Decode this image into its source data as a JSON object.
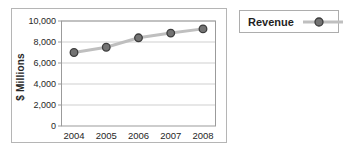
{
  "chart_data": {
    "type": "line",
    "categories": [
      "2004",
      "2005",
      "2006",
      "2007",
      "2008"
    ],
    "series": [
      {
        "name": "Revenue",
        "values": [
          7000,
          7500,
          8400,
          8850,
          9250
        ]
      }
    ],
    "ylabel": "$ Millions",
    "ylim": [
      0,
      10000
    ],
    "ytick_step": 2000,
    "ytick_labels": [
      "0",
      "2,000",
      "4,000",
      "6,000",
      "8,000",
      "10,000"
    ],
    "grid": true,
    "legend_position": "outside-top-right",
    "colors": {
      "line": "#bfbfbf",
      "marker_fill": "#737373",
      "marker_stroke": "#3d3d3d",
      "grid": "#cfcfcf",
      "axis": "#9b9b9b",
      "text": "#262626",
      "panel_border": "#b5b5b5",
      "legend_border": "#adadad"
    }
  }
}
